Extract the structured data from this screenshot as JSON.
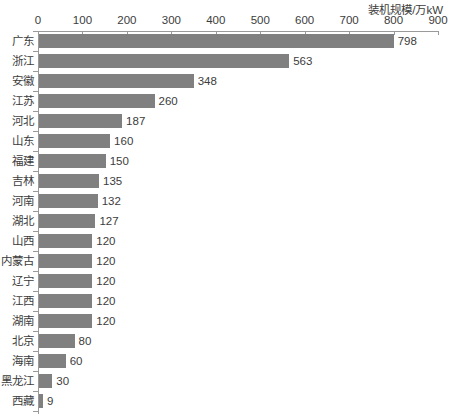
{
  "chart_data": {
    "type": "bar",
    "orientation": "horizontal",
    "title": "",
    "xlabel": "装机规模/万kW",
    "ylabel": "",
    "xlim": [
      0,
      900
    ],
    "xticks": [
      0,
      100,
      200,
      300,
      400,
      500,
      600,
      700,
      800,
      900
    ],
    "grid": false,
    "legend": null,
    "bar_color": "#808080",
    "axis_color": "#9a9a9a",
    "text_color": "#3c3c3c",
    "categories": [
      "广东",
      "浙江",
      "安徽",
      "江苏",
      "河北",
      "山东",
      "福建",
      "吉林",
      "河南",
      "湖北",
      "山西",
      "内蒙古",
      "辽宁",
      "江西",
      "湖南",
      "北京",
      "海南",
      "黑龙江",
      "西藏"
    ],
    "values": [
      798,
      563,
      348,
      260,
      187,
      160,
      150,
      135,
      132,
      127,
      120,
      120,
      120,
      120,
      120,
      80,
      60,
      30,
      9
    ],
    "data_labels": [
      "798",
      "563",
      "348",
      "260",
      "187",
      "160",
      "150",
      "135",
      "132",
      "127",
      "120",
      "120",
      "120",
      "120",
      "120",
      "80",
      "60",
      "30",
      "9"
    ]
  }
}
